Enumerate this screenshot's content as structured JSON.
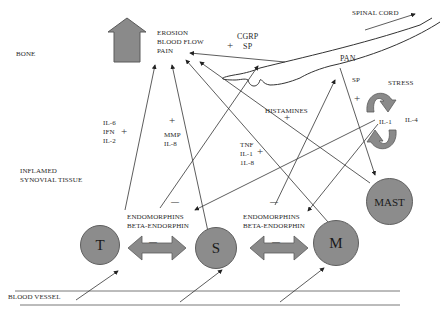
{
  "regions": {
    "bone": "BONE",
    "synovial_line1": "INFLAMED",
    "synovial_line2": "SYNOVIAL TISSUE",
    "blood_vessel": "BLOOD VESSEL",
    "spinal_cord": "SPINAL CORD"
  },
  "outcomes": [
    "EROSION",
    "BLOOD FLOW",
    "PAIN"
  ],
  "neuro": {
    "cgrp_sp": [
      "CGRP",
      "SP"
    ],
    "pan": "PAN",
    "sp": "SP",
    "stress": "STRESS",
    "il1": "IL-1",
    "il4": "IL-4",
    "histamines": "HISTAMINES"
  },
  "mediators": {
    "t_cell": [
      "IL-6",
      "IFN",
      "IL-2"
    ],
    "synoviocyte": [
      "MMP",
      "IL-8"
    ],
    "macrophage": [
      "TNF",
      "IL-1",
      "1L-8"
    ]
  },
  "endorphins": {
    "left": [
      "ENDOMORPHINS",
      "BETA-ENDORPHIN"
    ],
    "right": [
      "ENDOMORPHINS",
      "BETA-ENDORPHIN"
    ]
  },
  "signs": {
    "plus": "+",
    "minus": "—"
  },
  "cells": {
    "t": "T",
    "s": "S",
    "m": "M",
    "mast": "MAST"
  },
  "colors": {
    "cell_fill": "#8c8c8c",
    "arrow_fill": "#8a8a8a",
    "line": "#333333"
  }
}
